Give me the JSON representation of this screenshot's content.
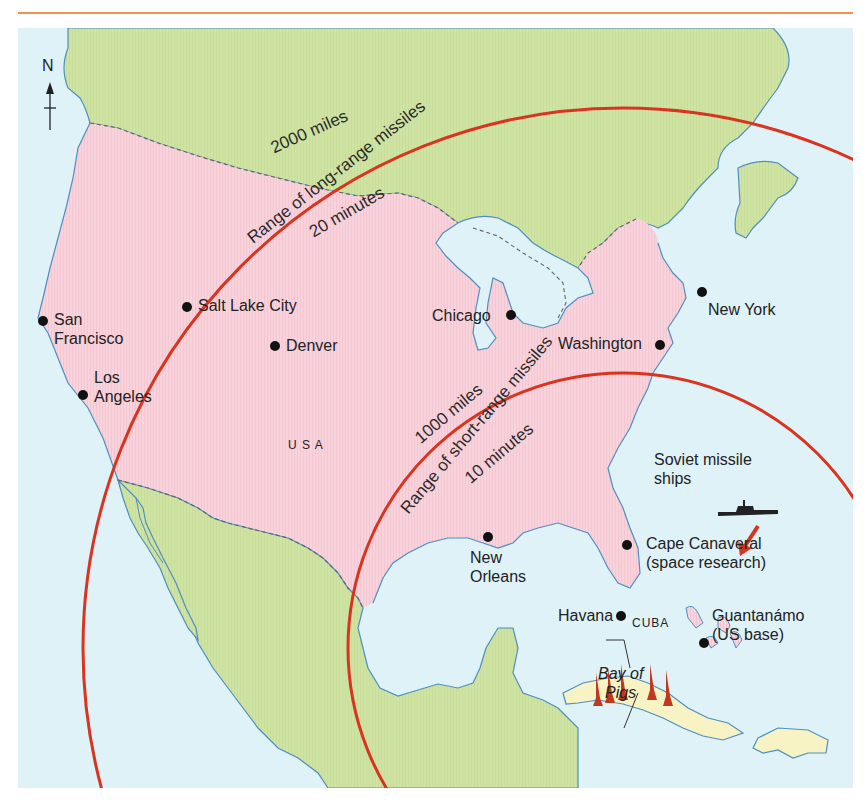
{
  "map": {
    "title_rule_color": "#f0934f",
    "colors": {
      "sea": "#dff2f8",
      "usa": "#f9d3dc",
      "other_land": "#cfe3a3",
      "cuba": "#f7f3c4",
      "coastline": "#4f8fc0",
      "border": "#666666",
      "range_ring": "#d9341f",
      "missile": "#c0391f"
    },
    "compass": {
      "label": "N",
      "icon": "north-arrow-icon"
    },
    "country_labels": {
      "usa": "U S A",
      "cuba": "CUBA"
    },
    "cities": [
      {
        "name_line1": "San",
        "name_line2": "Francisco"
      },
      {
        "name_line1": "Salt Lake City"
      },
      {
        "name_line1": "Denver"
      },
      {
        "name_line1": "Los",
        "name_line2": "Angeles"
      },
      {
        "name_line1": "Chicago"
      },
      {
        "name_line1": "New York"
      },
      {
        "name_line1": "Washington"
      },
      {
        "name_line1": "New",
        "name_line2": "Orleans"
      },
      {
        "name_line1": "Cape Canaveral",
        "name_line2": "(space research)"
      },
      {
        "name_line1": "Havana"
      },
      {
        "name_line1": "Guantanámo",
        "name_line2": "(US base)"
      }
    ],
    "annotations": {
      "bay_of_pigs_line1": "Bay of",
      "bay_of_pigs_line2": "Pigs",
      "ships_line1": "Soviet missile",
      "ships_line2": "ships"
    },
    "ranges": [
      {
        "distance": "2000 miles",
        "description": "Range of long-range missiles",
        "time": "20 minutes"
      },
      {
        "distance": "1000 miles",
        "description": "Range of short-range missiles",
        "time": "10 minutes"
      }
    ]
  }
}
